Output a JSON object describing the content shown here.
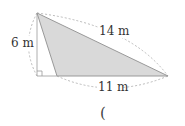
{
  "diagram": {
    "shape": "triangle",
    "height_label": "6 m",
    "side_label": "14 m",
    "base_label": "11 m",
    "answer_paren": "(",
    "colors": {
      "fill": "#d9d9d9",
      "stroke": "#999999",
      "dashed": "#aaaaaa"
    }
  }
}
